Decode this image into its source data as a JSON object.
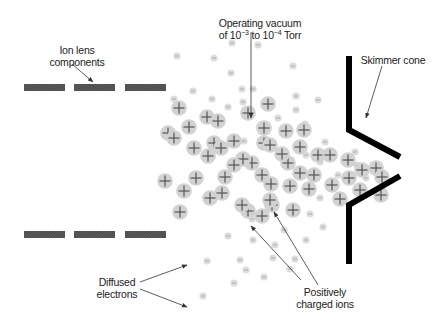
{
  "diagram": {
    "labels": {
      "ion_lens_line1": "Ion lens",
      "ion_lens_line2": "components",
      "vacuum_line1": "Operating vacuum",
      "vacuum_line2_prefix": "of 10",
      "vacuum_exp1": "−3",
      "vacuum_mid": " to 10",
      "vacuum_exp2": "−4",
      "vacuum_suffix": " Torr",
      "skimmer": "Skimmer cone",
      "electrons_line1": "Diffused",
      "electrons_line2": "electrons",
      "ions_line1": "Positively",
      "ions_line2": "charged ions"
    },
    "colors": {
      "lens_fill": "#555555",
      "cone": "#000000",
      "ion_fill": "#d2d2d2",
      "ion_cross": "#555555",
      "electron_fill": "#dcdcdc",
      "electron_mark": "#a8a8a8",
      "arrow": "#333333"
    },
    "lens_plates": [
      {
        "x": 24,
        "y": 84,
        "w": 41,
        "h": 7
      },
      {
        "x": 74,
        "y": 84,
        "w": 41,
        "h": 7
      },
      {
        "x": 125,
        "y": 84,
        "w": 41,
        "h": 7
      },
      {
        "x": 24,
        "y": 231,
        "w": 41,
        "h": 7
      },
      {
        "x": 74,
        "y": 231,
        "w": 41,
        "h": 7
      },
      {
        "x": 125,
        "y": 231,
        "w": 41,
        "h": 7
      }
    ],
    "ions": [
      [
        179,
        108
      ],
      [
        189,
        127
      ],
      [
        168,
        133
      ],
      [
        207,
        117
      ],
      [
        218,
        121
      ],
      [
        234,
        141
      ],
      [
        174,
        138
      ],
      [
        214,
        143
      ],
      [
        221,
        148
      ],
      [
        248,
        113
      ],
      [
        264,
        128
      ],
      [
        264,
        143
      ],
      [
        286,
        131
      ],
      [
        268,
        104
      ],
      [
        304,
        130
      ],
      [
        300,
        147
      ],
      [
        288,
        163
      ],
      [
        252,
        163
      ],
      [
        262,
        175
      ],
      [
        290,
        186
      ],
      [
        208,
        156
      ],
      [
        194,
        148
      ],
      [
        196,
        178
      ],
      [
        225,
        177
      ],
      [
        243,
        159
      ],
      [
        234,
        165
      ],
      [
        165,
        181
      ],
      [
        184,
        191
      ],
      [
        222,
        193
      ],
      [
        180,
        212
      ],
      [
        210,
        198
      ],
      [
        248,
        211
      ],
      [
        242,
        205
      ],
      [
        272,
        205
      ],
      [
        270,
        200
      ],
      [
        293,
        210
      ],
      [
        262,
        216
      ],
      [
        318,
        155
      ],
      [
        330,
        155
      ],
      [
        348,
        160
      ],
      [
        349,
        178
      ],
      [
        340,
        199
      ],
      [
        362,
        170
      ],
      [
        376,
        168
      ],
      [
        382,
        177
      ],
      [
        381,
        195
      ],
      [
        332,
        185
      ],
      [
        360,
        190
      ],
      [
        309,
        189
      ],
      [
        314,
        175
      ],
      [
        270,
        145
      ],
      [
        282,
        154
      ],
      [
        300,
        173
      ],
      [
        271,
        184
      ]
    ],
    "electrons": [
      [
        177,
        56
      ],
      [
        214,
        58
      ],
      [
        232,
        43
      ],
      [
        258,
        45
      ],
      [
        293,
        66
      ],
      [
        231,
        73
      ],
      [
        242,
        89
      ],
      [
        212,
        99
      ],
      [
        193,
        91
      ],
      [
        174,
        99
      ],
      [
        228,
        107
      ],
      [
        243,
        102
      ],
      [
        296,
        96
      ],
      [
        296,
        110
      ],
      [
        260,
        126
      ],
      [
        278,
        118
      ],
      [
        318,
        100
      ],
      [
        253,
        89
      ],
      [
        305,
        124
      ],
      [
        244,
        141
      ],
      [
        306,
        155
      ],
      [
        325,
        142
      ],
      [
        320,
        162
      ],
      [
        338,
        175
      ],
      [
        355,
        152
      ],
      [
        357,
        165
      ],
      [
        366,
        178
      ],
      [
        362,
        189
      ],
      [
        320,
        198
      ],
      [
        310,
        214
      ],
      [
        323,
        227
      ],
      [
        284,
        230
      ],
      [
        275,
        245
      ],
      [
        253,
        240
      ],
      [
        295,
        259
      ],
      [
        246,
        270
      ],
      [
        240,
        260
      ],
      [
        264,
        277
      ],
      [
        207,
        261
      ],
      [
        203,
        296
      ],
      [
        234,
        283
      ],
      [
        228,
        236
      ],
      [
        306,
        240
      ],
      [
        240,
        207
      ],
      [
        252,
        219
      ],
      [
        273,
        258
      ],
      [
        290,
        269
      ]
    ],
    "cone": {
      "upper": [
        [
          349,
          56
        ],
        [
          349,
          130
        ],
        [
          400,
          157
        ]
      ],
      "lower": [
        [
          400,
          176
        ],
        [
          349,
          205
        ],
        [
          349,
          264
        ]
      ],
      "thickness": 6
    },
    "arrows": [
      {
        "name": "ion-lens-arrow",
        "from": [
          72,
          64
        ],
        "to": [
          93,
          82
        ]
      },
      {
        "name": "vacuum-arrow",
        "from": [
          251,
          32
        ],
        "to": [
          251,
          118
        ]
      },
      {
        "name": "skimmer-arrow",
        "from": [
          382,
          66
        ],
        "to": [
          366,
          118
        ]
      },
      {
        "name": "electrons-arrow-upper",
        "from": [
          140,
          282
        ],
        "to": [
          187,
          265
        ]
      },
      {
        "name": "electrons-arrow-lower",
        "from": [
          140,
          289
        ],
        "to": [
          187,
          307
        ]
      },
      {
        "name": "ions-arrow-left",
        "from": [
          301,
          280
        ],
        "to": [
          251,
          226
        ]
      },
      {
        "name": "ions-arrow-right",
        "from": [
          318,
          285
        ],
        "to": [
          274,
          212
        ]
      }
    ]
  }
}
